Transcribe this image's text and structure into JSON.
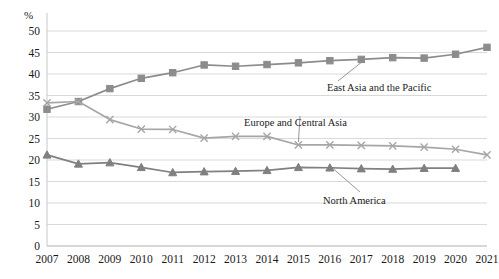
{
  "chart_data": {
    "type": "line",
    "title": "",
    "xlabel": "",
    "ylabel": "%",
    "ylim": [
      0,
      50
    ],
    "ytick_step": 5,
    "grid": "horizontal",
    "legend_position": "inline-annotations",
    "categories": [
      "2007",
      "2008",
      "2009",
      "2010",
      "2011",
      "2012",
      "2013",
      "2014",
      "2015",
      "2016",
      "2017",
      "2018",
      "2019",
      "2020",
      "2021"
    ],
    "yticks": [
      "0",
      "5",
      "10",
      "15",
      "20",
      "25",
      "30",
      "35",
      "40",
      "45",
      "50"
    ],
    "series": [
      {
        "name": "East Asia and the Pacific",
        "marker": "square",
        "color": "#8c8c8c",
        "values": [
          31.8,
          33.6,
          36.6,
          39.0,
          40.3,
          42.1,
          41.8,
          42.2,
          42.6,
          43.1,
          43.4,
          43.8,
          43.7,
          44.6,
          46.2
        ]
      },
      {
        "name": "Europe and Central Asia",
        "marker": "cross",
        "color": "#a6a6a6",
        "values": [
          33.3,
          33.6,
          29.4,
          27.2,
          27.1,
          25.1,
          25.5,
          25.5,
          23.5,
          23.5,
          23.4,
          23.3,
          23.0,
          22.5,
          21.2
        ]
      },
      {
        "name": "North America",
        "marker": "triangle",
        "color": "#808080",
        "values": [
          21.2,
          19.1,
          19.4,
          18.3,
          17.1,
          17.3,
          17.4,
          17.6,
          18.3,
          18.2,
          18.0,
          17.9,
          18.1,
          18.1,
          null
        ]
      }
    ],
    "annotations": [
      {
        "text": "East Asia and the Pacific",
        "x": 327,
        "y": 89
      },
      {
        "text": "Europe and Central Asia",
        "x": 244,
        "y": 124
      },
      {
        "text": "North America",
        "x": 323,
        "y": 202
      }
    ]
  }
}
